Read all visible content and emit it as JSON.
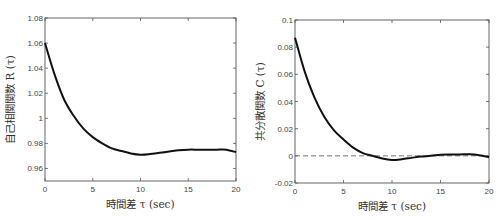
{
  "chart_data": [
    {
      "type": "line",
      "title": "",
      "xlabel": "時間差 τ (sec)",
      "ylabel": "自己相関関数 R (τ)",
      "xlim": [
        0,
        20
      ],
      "ylim": [
        0.95,
        1.08
      ],
      "xticks": [
        0,
        5,
        10,
        15,
        20
      ],
      "xtick_labels": [
        "0",
        "5",
        "10",
        "15",
        "20"
      ],
      "yticks": [
        0.96,
        0.98,
        1.0,
        1.02,
        1.04,
        1.06,
        1.08
      ],
      "ytick_labels": [
        "0.96",
        "0.98",
        "1",
        "1.02",
        "1.04",
        "1.06",
        "1.08"
      ],
      "grid": false,
      "legend": null,
      "series": [
        {
          "name": "R(τ)",
          "x": [
            0,
            1,
            2,
            3,
            4,
            5,
            6,
            7,
            8,
            9,
            10,
            11,
            12,
            13,
            14,
            15,
            16,
            17,
            18,
            19,
            20
          ],
          "values": [
            1.06,
            1.035,
            1.015,
            1.002,
            0.992,
            0.985,
            0.98,
            0.976,
            0.974,
            0.972,
            0.971,
            0.9715,
            0.9725,
            0.9735,
            0.9745,
            0.975,
            0.975,
            0.975,
            0.975,
            0.975,
            0.973
          ]
        }
      ]
    },
    {
      "type": "line",
      "title": "",
      "xlabel": "時間差 τ (sec)",
      "ylabel": "共分散関数 C (τ)",
      "xlim": [
        0,
        20
      ],
      "ylim": [
        -0.02,
        0.1
      ],
      "xticks": [
        0,
        5,
        10,
        15,
        20
      ],
      "xtick_labels": [
        "0",
        "5",
        "10",
        "15",
        "20"
      ],
      "yticks": [
        -0.02,
        0,
        0.02,
        0.04,
        0.06,
        0.08,
        0.1
      ],
      "ytick_labels": [
        "-0.02",
        "0",
        "0.02",
        "0.04",
        "0.06",
        "0.08",
        "0.1"
      ],
      "grid": false,
      "legend": null,
      "annotations": [
        {
          "type": "hline",
          "y": 0,
          "style": "dashed"
        }
      ],
      "series": [
        {
          "name": "C(τ)",
          "x": [
            0,
            1,
            2,
            3,
            4,
            5,
            6,
            7,
            8,
            9,
            10,
            11,
            12,
            13,
            14,
            15,
            16,
            17,
            18,
            19,
            20
          ],
          "values": [
            0.087,
            0.062,
            0.043,
            0.029,
            0.019,
            0.012,
            0.006,
            0.002,
            0.0,
            -0.002,
            -0.003,
            -0.0025,
            -0.0015,
            -0.0005,
            0.0,
            0.0008,
            0.001,
            0.001,
            0.0012,
            0.0005,
            -0.001
          ]
        }
      ]
    }
  ]
}
